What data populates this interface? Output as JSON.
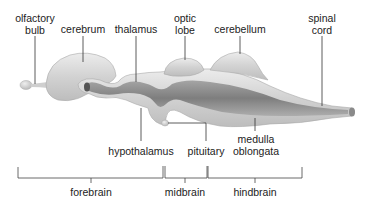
{
  "diagram": {
    "colors": {
      "tissue_light": "#e4e4e4",
      "tissue_mid": "#c8c8c8",
      "tissue_dark": "#7a7a7a",
      "leader_line": "#333333",
      "text": "#222222"
    },
    "top_labels": [
      {
        "id": "olfactory-bulb",
        "line1": "olfactory",
        "line2": "bulb"
      },
      {
        "id": "cerebrum",
        "line1": "cerebrum"
      },
      {
        "id": "thalamus",
        "line1": "thalamus"
      },
      {
        "id": "optic-lobe",
        "line1": "optic",
        "line2": "lobe"
      },
      {
        "id": "cerebellum",
        "line1": "cerebellum"
      },
      {
        "id": "spinal-cord",
        "line1": "spinal",
        "line2": "cord"
      }
    ],
    "bottom_labels": [
      {
        "id": "hypothalamus",
        "line1": "hypothalamus"
      },
      {
        "id": "pituitary",
        "line1": "pituitary"
      },
      {
        "id": "medulla-oblongata",
        "line1": "medulla",
        "line2": "oblongata"
      }
    ],
    "divisions": [
      {
        "id": "forebrain",
        "label": "forebrain"
      },
      {
        "id": "midbrain",
        "label": "midbrain"
      },
      {
        "id": "hindbrain",
        "label": "hindbrain"
      }
    ]
  }
}
